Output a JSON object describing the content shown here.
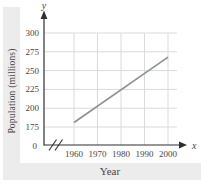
{
  "page": {
    "background": "#ffffff",
    "scan_band_color": "#ececec"
  },
  "chart_data": {
    "type": "line",
    "title": "",
    "xlabel": "Year",
    "ylabel": "Population (millions)",
    "x_axis_letter": "x",
    "y_axis_letter": "y",
    "origin_label": "0",
    "xticks": [
      1960,
      1970,
      1980,
      1990,
      2000
    ],
    "yticks": [
      175,
      200,
      225,
      250,
      275,
      300
    ],
    "xlim": [
      1960,
      2000
    ],
    "ylim": [
      175,
      300
    ],
    "x_axis_break": true,
    "grid": true,
    "legend": "none",
    "series": [
      {
        "name": "population-trend",
        "points": [
          [
            1960,
            181
          ],
          [
            2000,
            268
          ]
        ]
      }
    ],
    "colors": {
      "line": "#8e9090",
      "grid": "#d8dbde",
      "axis": "#2f2f2f",
      "text": "#4b4343"
    }
  }
}
